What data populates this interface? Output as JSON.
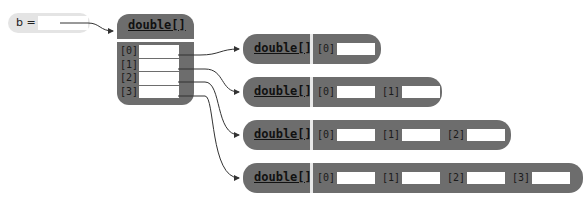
{
  "variable": {
    "name": "b",
    "label": "b ="
  },
  "outer_array": {
    "type_label": "double[]",
    "indices": [
      "[0]",
      "[1]",
      "[2]",
      "[3]"
    ]
  },
  "row_arrays": [
    {
      "type_label": "double[]",
      "indices": [
        "[0]"
      ]
    },
    {
      "type_label": "double[]",
      "indices": [
        "[0]",
        "[1]"
      ]
    },
    {
      "type_label": "double[]",
      "indices": [
        "[0]",
        "[1]",
        "[2]"
      ]
    },
    {
      "type_label": "double[]",
      "indices": [
        "[0]",
        "[1]",
        "[2]",
        "[3]"
      ]
    }
  ],
  "colors": {
    "box": "#6d6d6d",
    "variable_bg": "#e4e4e4",
    "slot": "#ffffff",
    "divider": "#e8e8e8",
    "line": "#333333"
  }
}
